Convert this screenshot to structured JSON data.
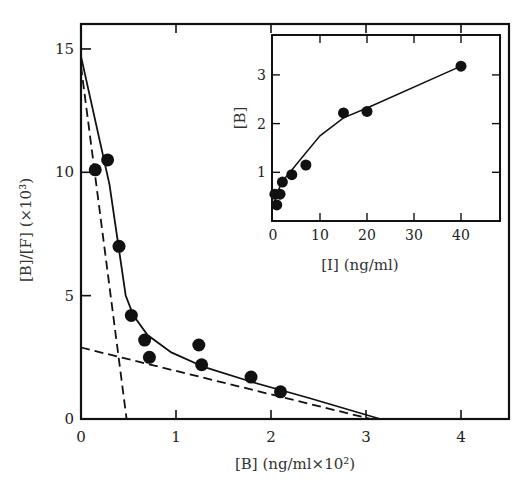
{
  "chart_data": [
    {
      "id": "main",
      "type": "scatter",
      "title": "",
      "xlabel": "[B]  (ng/ml×10²)",
      "ylabel": "[B]/[F]  (×10³)",
      "xlim": [
        0,
        4.5
      ],
      "ylim": [
        0,
        16
      ],
      "xticks": [
        0,
        1,
        2,
        3,
        4
      ],
      "yticks": [
        0,
        5,
        10,
        15
      ],
      "grid": false,
      "legend": null,
      "series": [
        {
          "name": "data points",
          "kind": "scatter",
          "marker": "filled-circle",
          "points": [
            [
              0.15,
              10.1
            ],
            [
              0.28,
              10.5
            ],
            [
              0.4,
              7.0
            ],
            [
              0.53,
              4.2
            ],
            [
              0.67,
              3.2
            ],
            [
              0.72,
              2.5
            ],
            [
              1.24,
              3.0
            ],
            [
              1.27,
              2.2
            ],
            [
              1.79,
              1.7
            ],
            [
              2.1,
              1.1
            ]
          ]
        },
        {
          "name": "fitted curve",
          "kind": "line",
          "style": "solid",
          "points": [
            [
              0.0,
              14.7
            ],
            [
              0.3,
              9.5
            ],
            [
              0.47,
              5.0
            ],
            [
              0.55,
              4.2
            ],
            [
              0.7,
              3.4
            ],
            [
              0.95,
              2.7
            ],
            [
              1.3,
              2.1
            ],
            [
              1.8,
              1.5
            ],
            [
              2.4,
              0.85
            ],
            [
              3.15,
              0.0
            ]
          ]
        },
        {
          "name": "high-affinity component",
          "kind": "line",
          "style": "dashed",
          "points": [
            [
              0.0,
              14.3
            ],
            [
              0.48,
              0.0
            ]
          ]
        },
        {
          "name": "low-affinity component",
          "kind": "line",
          "style": "dashed",
          "points": [
            [
              0.0,
              2.9
            ],
            [
              3.05,
              0.0
            ]
          ]
        }
      ]
    },
    {
      "id": "inset",
      "type": "scatter",
      "title": "",
      "xlabel": "[I]  (ng/ml)",
      "ylabel": "[B]",
      "xlim": [
        0,
        48
      ],
      "ylim": [
        0,
        3.8
      ],
      "xticks": [
        0,
        10,
        20,
        30,
        40
      ],
      "yticks": [
        1,
        2,
        3
      ],
      "grid": false,
      "legend": null,
      "series": [
        {
          "name": "data points",
          "kind": "scatter",
          "marker": "filled-circle",
          "points": [
            [
              0.8,
              0.33
            ],
            [
              0.4,
              0.55
            ],
            [
              1.5,
              0.55
            ],
            [
              2.0,
              0.8
            ],
            [
              4.0,
              0.95
            ],
            [
              7.0,
              1.15
            ],
            [
              15.0,
              2.22
            ],
            [
              20.0,
              2.25
            ],
            [
              40.0,
              3.18
            ]
          ]
        },
        {
          "name": "fitted curve",
          "kind": "line",
          "style": "solid",
          "points": [
            [
              0.0,
              0.3
            ],
            [
              1.0,
              0.6
            ],
            [
              2.0,
              0.82
            ],
            [
              4.0,
              1.05
            ],
            [
              7.0,
              1.4
            ],
            [
              10.0,
              1.75
            ],
            [
              15.0,
              2.12
            ],
            [
              20.0,
              2.32
            ],
            [
              40.0,
              3.18
            ]
          ]
        }
      ]
    }
  ],
  "labels": {
    "main_x_ticks": [
      "0",
      "1",
      "2",
      "3",
      "4"
    ],
    "main_y_ticks": [
      "0",
      "5",
      "10",
      "15"
    ],
    "main_xlabel": "[B]  (ng/ml×10²)",
    "main_ylabel": "[B]/[F]  (×10³)",
    "inset_x_ticks": [
      "0",
      "10",
      "20",
      "30",
      "40"
    ],
    "inset_y_ticks": [
      "1",
      "2",
      "3"
    ],
    "inset_xlabel": "[I]  (ng/ml)",
    "inset_ylabel": "[B]"
  },
  "colors": {
    "ink": "#111111",
    "background": "#ffffff"
  }
}
